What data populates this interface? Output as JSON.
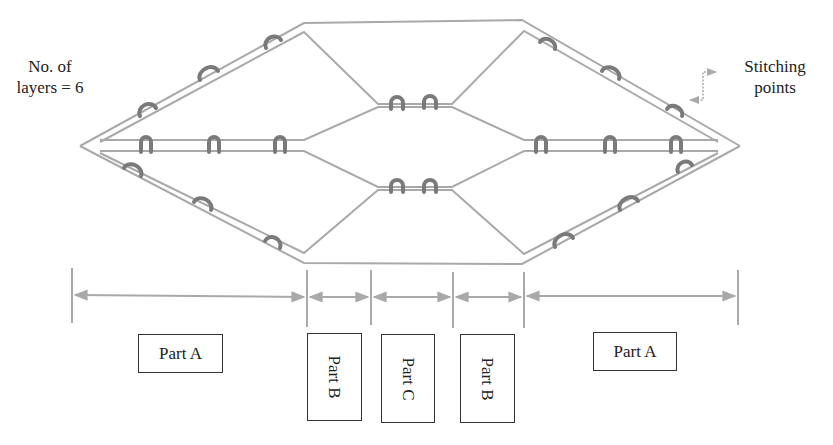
{
  "diagram": {
    "type": "multilayer-stitched-fabric-cross-section",
    "layers_label": "No. of layers = 6",
    "layers_label_lines": [
      "No. of",
      "layers = 6"
    ],
    "stitch_label_lines": [
      "Stitching",
      "points"
    ],
    "colors": {
      "fabric_line": "#a9a9a9",
      "stitch": "#7a7a7a",
      "dimension_line": "#a9a9a9",
      "box_border": "#333333",
      "text": "#222222"
    },
    "parts": [
      {
        "id": "part-a-left",
        "label": "Part A",
        "orientation": "horizontal"
      },
      {
        "id": "part-b-left",
        "label": "Part B",
        "orientation": "vertical"
      },
      {
        "id": "part-c",
        "label": "Part C",
        "orientation": "vertical"
      },
      {
        "id": "part-b-right",
        "label": "Part B",
        "orientation": "vertical"
      },
      {
        "id": "part-a-right",
        "label": "Part A",
        "orientation": "horizontal"
      }
    ],
    "dimension_ticks_x": [
      72,
      307,
      371,
      453,
      524,
      738
    ]
  }
}
